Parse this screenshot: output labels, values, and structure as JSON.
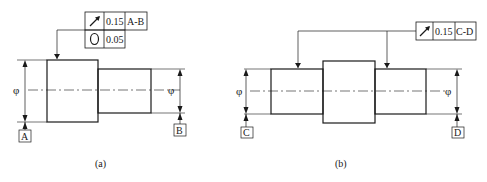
{
  "figure_a": {
    "caption": "(a)",
    "fcf": {
      "rows": [
        {
          "symbol": "circular-runout",
          "tolerance": "0.15",
          "datum": "A-B"
        },
        {
          "symbol": "circularity",
          "tolerance": "0.05",
          "datum": ""
        }
      ]
    },
    "diameter_left": "φ",
    "diameter_right": "φ",
    "datum_left": "A",
    "datum_right": "B"
  },
  "figure_b": {
    "caption": "(b)",
    "fcf": {
      "rows": [
        {
          "symbol": "circular-runout",
          "tolerance": "0.15",
          "datum": "C-D"
        }
      ]
    },
    "diameter_left": "φ",
    "diameter_right": "φ",
    "datum_left": "C",
    "datum_right": "D"
  },
  "colors": {
    "line": "#1a1a1a",
    "background": "#ffffff"
  }
}
